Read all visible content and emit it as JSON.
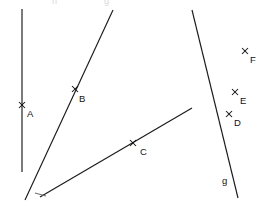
{
  "figure": {
    "width": 263,
    "height": 210,
    "background_color": "#ffffff",
    "stroke_color": "#1a1a1a"
  },
  "lines": [
    {
      "id": "line-vertical-left",
      "label": "",
      "x1": 22,
      "y1": 9,
      "x2": 22,
      "y2": 172,
      "style": "solid"
    },
    {
      "id": "line-through-b",
      "label": "",
      "x1": 113,
      "y1": 10,
      "x2": 25,
      "y2": 200,
      "style": "solid"
    },
    {
      "id": "line-through-c",
      "label": "",
      "x1": 192,
      "y1": 108,
      "x2": 40,
      "y2": 197,
      "style": "solid"
    },
    {
      "id": "line-g",
      "label": "g",
      "label_x": 222,
      "label_y": 181,
      "x1": 192,
      "y1": 10,
      "x2": 238,
      "y2": 198,
      "style": "solid"
    }
  ],
  "tick_segment": {
    "id": "arrow-tick-c-line",
    "x1": 35,
    "y1": 193,
    "x2": 46,
    "y2": 196
  },
  "points": [
    {
      "id": "point-a",
      "label": "A",
      "x": 22,
      "y": 105,
      "label_x": 27,
      "label_y": 114
    },
    {
      "id": "point-b",
      "label": "B",
      "x": 75,
      "y": 89,
      "label_x": 79,
      "label_y": 99
    },
    {
      "id": "point-c",
      "label": "C",
      "x": 133,
      "y": 143,
      "label_x": 140,
      "label_y": 152
    },
    {
      "id": "point-d",
      "label": "D",
      "x": 229,
      "y": 114,
      "label_x": 234,
      "label_y": 123
    },
    {
      "id": "point-e",
      "label": "E",
      "x": 235,
      "y": 92,
      "label_x": 240,
      "label_y": 101
    },
    {
      "id": "point-f",
      "label": "F",
      "x": 245,
      "y": 51,
      "label_x": 250,
      "label_y": 60
    }
  ],
  "clipped_labels": [
    {
      "id": "clipped-label-left",
      "text": "h",
      "x": 52,
      "y": 2
    },
    {
      "id": "clipped-label-right",
      "text": "g",
      "x": 104,
      "y": 2
    }
  ]
}
